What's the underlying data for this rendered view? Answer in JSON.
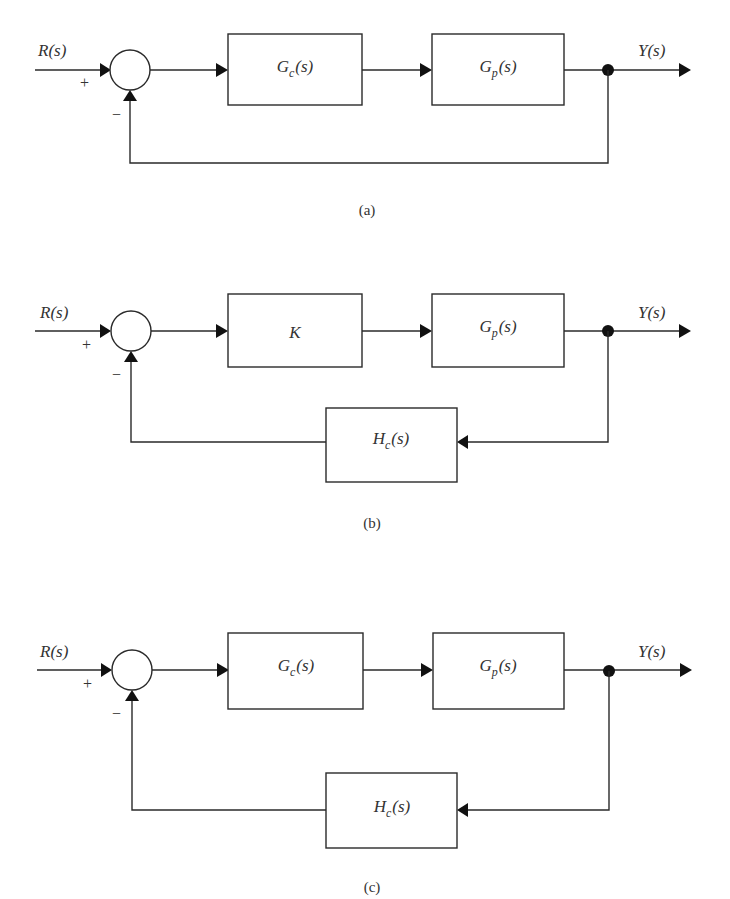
{
  "figure": {
    "diagrams": [
      {
        "id": "a",
        "caption": "(a)",
        "input_label": "R(s)",
        "output_label": "Y(s)",
        "plus_sign": "+",
        "minus_sign": "−",
        "forward_blocks": [
          {
            "main": "G",
            "sub": "c",
            "arg": "(s)"
          },
          {
            "main": "G",
            "sub": "p",
            "arg": "(s)"
          }
        ],
        "feedback_block": null
      },
      {
        "id": "b",
        "caption": "(b)",
        "input_label": "R(s)",
        "output_label": "Y(s)",
        "plus_sign": "+",
        "minus_sign": "−",
        "forward_blocks": [
          {
            "main": "K",
            "sub": "",
            "arg": ""
          },
          {
            "main": "G",
            "sub": "p",
            "arg": "(s)"
          }
        ],
        "feedback_block": {
          "main": "H",
          "sub": "c",
          "arg": "(s)"
        }
      },
      {
        "id": "c",
        "caption": "(c)",
        "input_label": "R(s)",
        "output_label": "Y(s)",
        "plus_sign": "+",
        "minus_sign": "−",
        "forward_blocks": [
          {
            "main": "G",
            "sub": "c",
            "arg": "(s)"
          },
          {
            "main": "G",
            "sub": "p",
            "arg": "(s)"
          }
        ],
        "feedback_block": {
          "main": "H",
          "sub": "c",
          "arg": "(s)"
        }
      }
    ]
  }
}
